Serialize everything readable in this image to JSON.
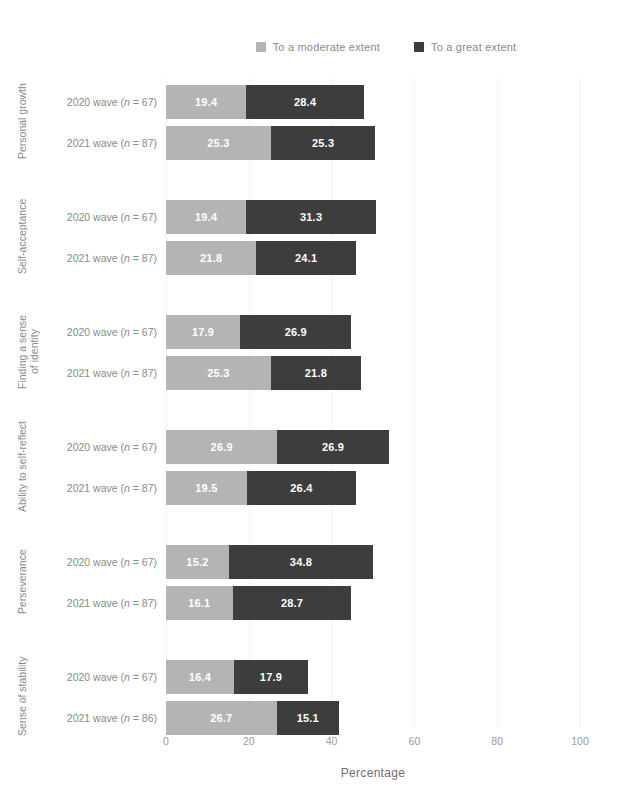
{
  "legend": {
    "items": [
      {
        "label": "To a moderate extent",
        "color": "#b4b4b4",
        "icon": "legend-swatch-moderate"
      },
      {
        "label": "To a great extent",
        "color": "#3d3d3d",
        "icon": "legend-swatch-great"
      }
    ]
  },
  "axis": {
    "x_title": "Percentage",
    "x_ticks": [
      "0",
      "20",
      "40",
      "60",
      "80",
      "100"
    ]
  },
  "chart_data": {
    "type": "bar",
    "orientation": "horizontal",
    "stacked": true,
    "title": "",
    "xlabel": "Percentage",
    "ylabel": "",
    "xlim": [
      0,
      100
    ],
    "xticks": [
      0,
      20,
      40,
      60,
      80,
      100
    ],
    "grid": true,
    "legend_position": "top",
    "series": [
      {
        "name": "To a moderate extent",
        "color": "#b4b4b4"
      },
      {
        "name": "To a great extent",
        "color": "#3d3d3d"
      }
    ],
    "categories": [
      "Personal growth",
      "Self-acceptance",
      "Finding a sense\nof identity",
      "Ability to self-reflect",
      "Perseverance",
      "Sense of stability"
    ],
    "groups": [
      {
        "category": "Personal growth",
        "rows": [
          {
            "label": "2020 wave (n = 67)",
            "wave": "2020 wave",
            "n": 67,
            "moderate": 19.4,
            "great": 28.4
          },
          {
            "label": "2021 wave (n = 87)",
            "wave": "2021 wave",
            "n": 87,
            "moderate": 25.3,
            "great": 25.3
          }
        ]
      },
      {
        "category": "Self-acceptance",
        "rows": [
          {
            "label": "2020 wave (n = 67)",
            "wave": "2020 wave",
            "n": 67,
            "moderate": 19.4,
            "great": 31.3
          },
          {
            "label": "2021 wave (n = 87)",
            "wave": "2021 wave",
            "n": 87,
            "moderate": 21.8,
            "great": 24.1
          }
        ]
      },
      {
        "category": "Finding a sense\nof identity",
        "rows": [
          {
            "label": "2020 wave (n = 67)",
            "wave": "2020 wave",
            "n": 67,
            "moderate": 17.9,
            "great": 26.9
          },
          {
            "label": "2021 wave (n = 87)",
            "wave": "2021 wave",
            "n": 87,
            "moderate": 25.3,
            "great": 21.8
          }
        ]
      },
      {
        "category": "Ability to self-reflect",
        "rows": [
          {
            "label": "2020 wave (n = 67)",
            "wave": "2020 wave",
            "n": 67,
            "moderate": 26.9,
            "great": 26.9
          },
          {
            "label": "2021 wave (n = 87)",
            "wave": "2021 wave",
            "n": 87,
            "moderate": 19.5,
            "great": 26.4
          }
        ]
      },
      {
        "category": "Perseverance",
        "rows": [
          {
            "label": "2020 wave (n = 67)",
            "wave": "2020 wave",
            "n": 67,
            "moderate": 15.2,
            "great": 34.8
          },
          {
            "label": "2021 wave (n = 87)",
            "wave": "2021 wave",
            "n": 87,
            "moderate": 16.1,
            "great": 28.7
          }
        ]
      },
      {
        "category": "Sense of stability",
        "rows": [
          {
            "label": "2020 wave (n = 67)",
            "wave": "2020 wave",
            "n": 67,
            "moderate": 16.4,
            "great": 17.9
          },
          {
            "label": "2021 wave (n = 86)",
            "wave": "2021 wave",
            "n": 86,
            "moderate": 26.7,
            "great": 15.1
          }
        ]
      }
    ]
  }
}
